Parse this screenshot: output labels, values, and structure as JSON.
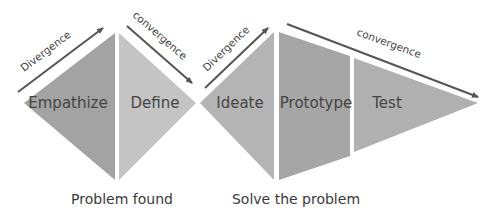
{
  "diagram": {
    "title": "",
    "stages": [
      {
        "label": "Empathize",
        "color": "#a3a3a3"
      },
      {
        "label": "Define",
        "color": "#c4c4c4"
      },
      {
        "label": "Ideate",
        "color": "#b4b4b4"
      },
      {
        "label": "Prototype",
        "color": "#a6a6a6"
      },
      {
        "label": "Test",
        "color": "#b0b0b0"
      }
    ],
    "arrows": [
      {
        "label": "Divergence"
      },
      {
        "label": "convergence"
      },
      {
        "label": "Divergence"
      },
      {
        "label": "convergence"
      }
    ],
    "captions": [
      {
        "label": "Problem found"
      },
      {
        "label": "Solve the problem"
      }
    ],
    "arrow_color": "#555555"
  }
}
